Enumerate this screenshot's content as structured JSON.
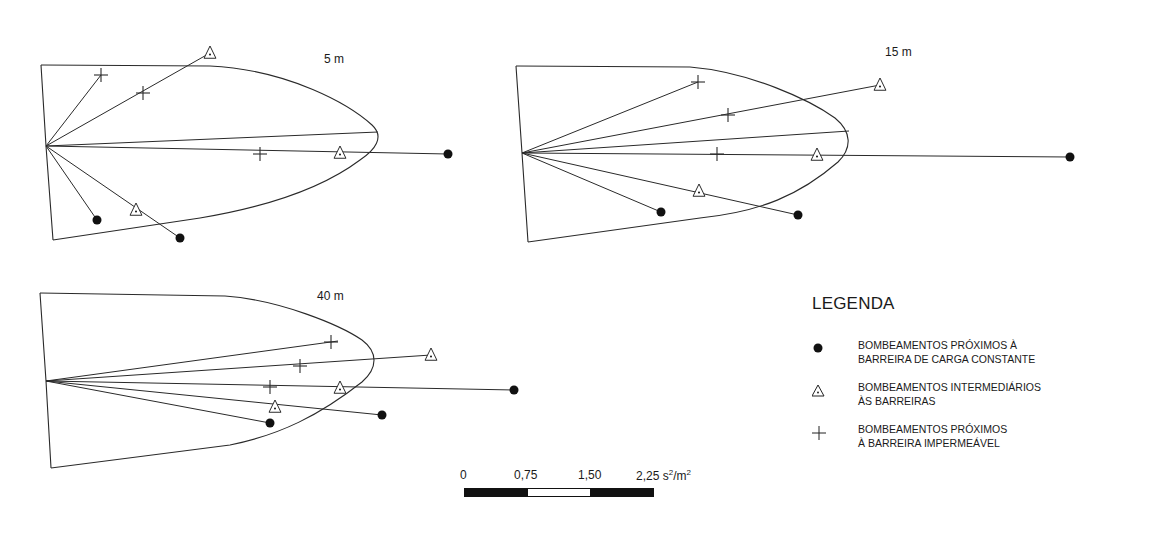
{
  "panels": [
    {
      "label": "5 m",
      "boundary": {
        "top_left": [
          41,
          65
        ],
        "bottom_left": [
          53,
          240
        ],
        "vertex": [
          46,
          146
        ]
      },
      "envelope_path": "M41,65 L210,66 C290,70 350,105 372,125 C385,137 375,150 360,160 C320,190 260,208 200,218 L53,240",
      "markers": [
        {
          "type": "plus",
          "x": 101,
          "y": 75
        },
        {
          "type": "plus",
          "x": 143,
          "y": 93
        },
        {
          "type": "triangle",
          "x": 210,
          "y": 53
        },
        {
          "type": "end",
          "x": 378,
          "y": 132
        },
        {
          "type": "plus",
          "x": 260,
          "y": 154
        },
        {
          "type": "triangle",
          "x": 340,
          "y": 153
        },
        {
          "type": "dot",
          "x": 448,
          "y": 154
        },
        {
          "type": "dot",
          "x": 97,
          "y": 220
        },
        {
          "type": "triangle",
          "x": 136,
          "y": 210
        },
        {
          "type": "dot",
          "x": 180,
          "y": 238
        }
      ],
      "rays": [
        [
          101,
          75
        ],
        [
          210,
          53
        ],
        [
          378,
          132
        ],
        [
          448,
          154
        ],
        [
          97,
          220
        ],
        [
          180,
          238
        ]
      ],
      "label_pos": [
        324,
        63
      ]
    },
    {
      "label": "15 m",
      "boundary": {
        "top_left": [
          516,
          66
        ],
        "bottom_left": [
          528,
          242
        ],
        "vertex": [
          522,
          153
        ]
      },
      "envelope_path": "M516,66 L690,67 C750,72 810,100 835,118 C852,132 852,148 838,162 C800,195 760,212 700,218 L528,242",
      "markers": [
        {
          "type": "plus",
          "x": 698,
          "y": 82
        },
        {
          "type": "plus",
          "x": 728,
          "y": 115
        },
        {
          "type": "triangle",
          "x": 880,
          "y": 85
        },
        {
          "type": "end",
          "x": 849,
          "y": 131
        },
        {
          "type": "plus",
          "x": 717,
          "y": 154
        },
        {
          "type": "triangle",
          "x": 817,
          "y": 155
        },
        {
          "type": "dot",
          "x": 1070,
          "y": 157
        },
        {
          "type": "triangle",
          "x": 699,
          "y": 191
        },
        {
          "type": "dot",
          "x": 661,
          "y": 212
        },
        {
          "type": "dot",
          "x": 798,
          "y": 215
        }
      ],
      "rays": [
        [
          698,
          82
        ],
        [
          880,
          85
        ],
        [
          849,
          131
        ],
        [
          1070,
          157
        ],
        [
          661,
          212
        ],
        [
          798,
          215
        ]
      ],
      "label_pos": [
        885,
        56
      ]
    },
    {
      "label": "40 m",
      "boundary": {
        "top_left": [
          40,
          293
        ],
        "bottom_left": [
          51,
          468
        ],
        "vertex": [
          46,
          381
        ]
      },
      "envelope_path": "M40,293 L225,296 C280,300 340,325 362,340 C378,352 378,368 362,382 C320,415 280,435 230,445 L51,468",
      "markers": [
        {
          "type": "plus",
          "x": 331,
          "y": 342
        },
        {
          "type": "triangle",
          "x": 431,
          "y": 355
        },
        {
          "type": "plus",
          "x": 300,
          "y": 366
        },
        {
          "type": "plus",
          "x": 270,
          "y": 387
        },
        {
          "type": "triangle",
          "x": 340,
          "y": 388
        },
        {
          "type": "dot",
          "x": 514,
          "y": 390
        },
        {
          "type": "triangle",
          "x": 275,
          "y": 407
        },
        {
          "type": "dot",
          "x": 382,
          "y": 415
        },
        {
          "type": "dot",
          "x": 270,
          "y": 423
        }
      ],
      "rays": [
        [
          338,
          341
        ],
        [
          431,
          355
        ],
        [
          514,
          390
        ],
        [
          382,
          415
        ],
        [
          270,
          423
        ]
      ],
      "label_pos": [
        317,
        300
      ]
    }
  ],
  "legend": {
    "title": "LEGENDA",
    "items": [
      {
        "symbol": "dot",
        "line1": "BOMBEAMENTOS PRÓXIMOS À",
        "line2": "BARREIRA DE CARGA CONSTANTE"
      },
      {
        "symbol": "triangle",
        "line1": "BOMBEAMENTOS INTERMEDIÁRIOS",
        "line2": "ÀS BARREIRAS"
      },
      {
        "symbol": "plus",
        "line1": "BOMBEAMENTOS PRÓXIMOS",
        "line2": "À BARREIRA IMPERMEÁVEL"
      }
    ]
  },
  "scale_bar": {
    "ticks": [
      "0",
      "0,75",
      "1,50",
      "2,25"
    ],
    "unit_base": "s",
    "unit_exp1": "2",
    "unit_mid": "/m",
    "unit_exp2": "2"
  }
}
